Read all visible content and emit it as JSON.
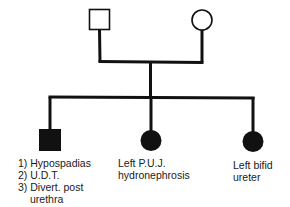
{
  "diagram": {
    "type": "pedigree",
    "colors": {
      "line": "#111111",
      "affected_fill": "#111111",
      "unaffected_fill": "#ffffff",
      "background": "#ffffff"
    },
    "generation_1": {
      "father": {
        "symbol": "square",
        "affected": false
      },
      "mother": {
        "symbol": "circle",
        "affected": false
      }
    },
    "generation_2": [
      {
        "symbol": "square",
        "sex": "male",
        "affected": true,
        "label_lines": [
          "1) Hypospadias",
          "2) U.D.T.",
          "3) Divert. post",
          "urethra"
        ]
      },
      {
        "symbol": "circle",
        "sex": "female",
        "affected": true,
        "label_lines": [
          "Left P.U.J.",
          "hydronephrosis"
        ]
      },
      {
        "symbol": "circle",
        "sex": "female",
        "affected": true,
        "label_lines": [
          "Left bifid",
          "ureter"
        ]
      }
    ]
  }
}
